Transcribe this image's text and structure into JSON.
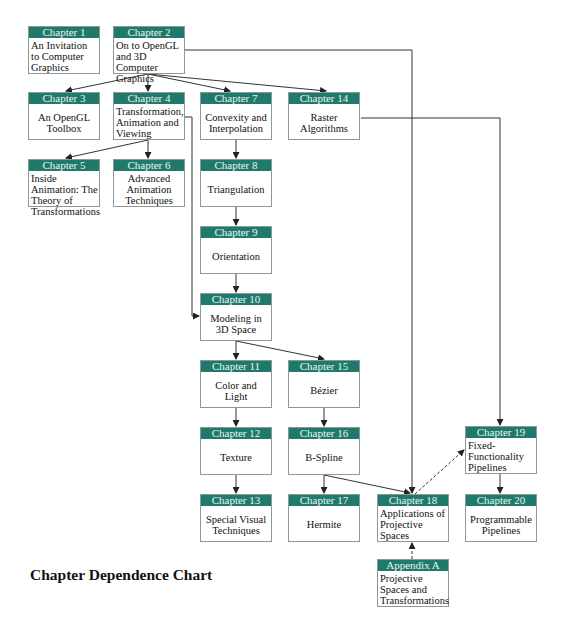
{
  "title": "Chapter Dependence Chart",
  "colors": {
    "header": "#1f7a6c",
    "border": "#8a9a98",
    "line": "#333333"
  },
  "nodes": [
    {
      "id": "ch1",
      "header": "Chapter 1",
      "body": "An Invitation to Computer Graphics",
      "x": 28,
      "y": 26,
      "align": "left"
    },
    {
      "id": "ch2",
      "header": "Chapter 2",
      "body": "On to OpenGL and 3D Computer Graphics",
      "x": 113,
      "y": 26,
      "align": "left"
    },
    {
      "id": "ch3",
      "header": "Chapter 3",
      "body": "An OpenGL Toolbox",
      "x": 28,
      "y": 92,
      "align": "center"
    },
    {
      "id": "ch4",
      "header": "Chapter 4",
      "body": "Transformation, Animation and Viewing",
      "x": 113,
      "y": 92,
      "align": "left"
    },
    {
      "id": "ch7",
      "header": "Chapter 7",
      "body": "Convexity and Interpolation",
      "x": 200,
      "y": 92,
      "align": "center"
    },
    {
      "id": "ch14",
      "header": "Chapter 14",
      "body": "Raster Algorithms",
      "x": 288,
      "y": 92,
      "align": "center"
    },
    {
      "id": "ch5",
      "header": "Chapter 5",
      "body": "Inside Animation: The Theory of Transformations",
      "x": 28,
      "y": 159,
      "align": "left"
    },
    {
      "id": "ch6",
      "header": "Chapter 6",
      "body": "Advanced Animation Techniques",
      "x": 113,
      "y": 159,
      "align": "center"
    },
    {
      "id": "ch8",
      "header": "Chapter 8",
      "body": "Triangulation",
      "x": 200,
      "y": 159,
      "align": "center"
    },
    {
      "id": "ch9",
      "header": "Chapter 9",
      "body": "Orientation",
      "x": 200,
      "y": 226,
      "align": "center"
    },
    {
      "id": "ch10",
      "header": "Chapter 10",
      "body": "Modeling in 3D Space",
      "x": 200,
      "y": 293,
      "align": "center"
    },
    {
      "id": "ch11",
      "header": "Chapter 11",
      "body": "Color and Light",
      "x": 200,
      "y": 360,
      "align": "center"
    },
    {
      "id": "ch15",
      "header": "Chapter 15",
      "body": "Bézier",
      "x": 288,
      "y": 360,
      "align": "center"
    },
    {
      "id": "ch12",
      "header": "Chapter 12",
      "body": "Texture",
      "x": 200,
      "y": 427,
      "align": "center"
    },
    {
      "id": "ch16",
      "header": "Chapter 16",
      "body": "B-Spline",
      "x": 288,
      "y": 427,
      "align": "center"
    },
    {
      "id": "ch19",
      "header": "Chapter 19",
      "body": "Fixed-Functionality Pipelines",
      "x": 465,
      "y": 426,
      "align": "left"
    },
    {
      "id": "ch13",
      "header": "Chapter 13",
      "body": "Special Visual Techniques",
      "x": 200,
      "y": 494,
      "align": "center"
    },
    {
      "id": "ch17",
      "header": "Chapter 17",
      "body": "Hermite",
      "x": 288,
      "y": 494,
      "align": "center"
    },
    {
      "id": "ch18",
      "header": "Chapter 18",
      "body": "Applications of Projective Spaces",
      "x": 377,
      "y": 494,
      "align": "left"
    },
    {
      "id": "ch20",
      "header": "Chapter 20",
      "body": "Programmable Pipelines",
      "x": 465,
      "y": 494,
      "align": "center"
    },
    {
      "id": "appA",
      "header": "Appendix A",
      "body": "Projective Spaces and Transformations",
      "x": 377,
      "y": 559,
      "align": "left"
    }
  ],
  "edges": [
    {
      "from": "ch2",
      "to": "ch3",
      "style": "solid"
    },
    {
      "from": "ch2",
      "to": "ch4",
      "style": "solid"
    },
    {
      "from": "ch2",
      "to": "ch7",
      "style": "solid"
    },
    {
      "from": "ch2",
      "to": "ch14",
      "style": "solid"
    },
    {
      "from": "ch2",
      "to": "ch18",
      "style": "solid"
    },
    {
      "from": "ch4",
      "to": "ch5",
      "style": "solid"
    },
    {
      "from": "ch4",
      "to": "ch6",
      "style": "solid"
    },
    {
      "from": "ch4",
      "to": "ch10",
      "style": "solid"
    },
    {
      "from": "ch7",
      "to": "ch8",
      "style": "solid"
    },
    {
      "from": "ch8",
      "to": "ch9",
      "style": "solid"
    },
    {
      "from": "ch9",
      "to": "ch10",
      "style": "solid"
    },
    {
      "from": "ch10",
      "to": "ch11",
      "style": "solid"
    },
    {
      "from": "ch10",
      "to": "ch15",
      "style": "solid"
    },
    {
      "from": "ch11",
      "to": "ch12",
      "style": "solid"
    },
    {
      "from": "ch12",
      "to": "ch13",
      "style": "solid"
    },
    {
      "from": "ch15",
      "to": "ch16",
      "style": "solid"
    },
    {
      "from": "ch16",
      "to": "ch17",
      "style": "solid"
    },
    {
      "from": "ch16",
      "to": "ch18",
      "style": "solid"
    },
    {
      "from": "ch14",
      "to": "ch19",
      "style": "solid"
    },
    {
      "from": "ch19",
      "to": "ch20",
      "style": "solid"
    },
    {
      "from": "ch18",
      "to": "ch19",
      "style": "dashed"
    },
    {
      "from": "appA",
      "to": "ch18",
      "style": "dashed"
    }
  ]
}
